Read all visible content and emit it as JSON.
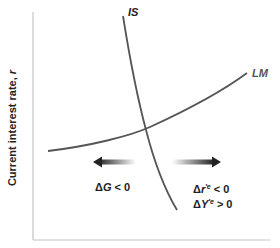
{
  "diagram": {
    "type": "IS-LM",
    "y_axis": {
      "label": "Current interest rate, ",
      "variable": "r"
    },
    "x_axis": {
      "label": ""
    },
    "curves": [
      {
        "name": "IS",
        "label": "IS",
        "color": "#555555"
      },
      {
        "name": "LM",
        "label": "LM",
        "color": "#555555"
      }
    ],
    "arrows": [
      {
        "direction": "left",
        "meaning": "fiscal contraction"
      },
      {
        "direction": "right",
        "meaning": "result"
      }
    ],
    "annotations": {
      "left": {
        "delta": "Δ",
        "var": "G",
        "rel": " < 0"
      },
      "right_line1": {
        "delta": "Δ",
        "var": "r",
        "sup": "′e",
        "rel": " < 0"
      },
      "right_line2": {
        "delta": "Δ",
        "var": "Y",
        "sup": "′e",
        "rel": " > 0"
      }
    },
    "colors": {
      "axis": "#bbbbbb",
      "curve": "#555555",
      "arrow": "#333333",
      "text": "#222222"
    }
  }
}
